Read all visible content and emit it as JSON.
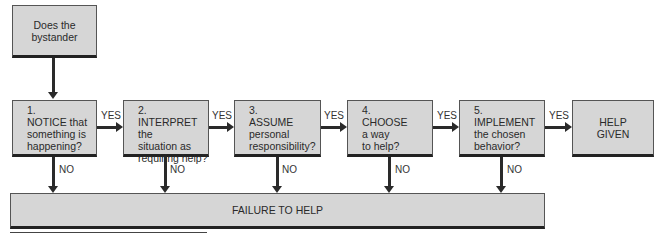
{
  "start": {
    "line1": "Does the",
    "line2": "bystander"
  },
  "steps": [
    {
      "num": "1.",
      "lines": [
        "NOTICE that",
        "something is",
        "happening?"
      ]
    },
    {
      "num": "2.",
      "lines": [
        "INTERPRET the",
        "situation as",
        "requiring help?"
      ]
    },
    {
      "num": "3.",
      "lines": [
        "ASSUME",
        "personal",
        "responsibility?"
      ]
    },
    {
      "num": "4.",
      "lines": [
        "CHOOSE",
        "a way",
        "to help?"
      ]
    },
    {
      "num": "5.",
      "lines": [
        "IMPLEMENT",
        "the chosen",
        "behavior?"
      ]
    }
  ],
  "end": {
    "line1": "HELP",
    "line2": "GIVEN"
  },
  "yes_label": "YES",
  "no_label": "NO",
  "failure": {
    "label": "FAILURE TO HELP"
  },
  "colors": {
    "box_fill": "#d6d6d6",
    "line": "#2a2a2a"
  }
}
